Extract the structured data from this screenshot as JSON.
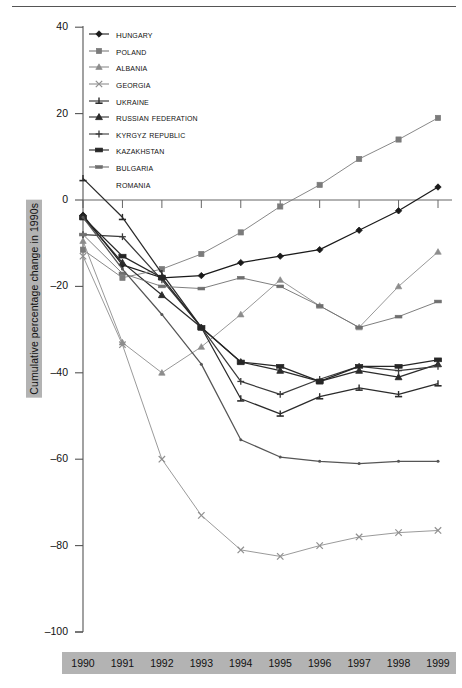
{
  "figure": {
    "top_rule": true,
    "background_color": "#ffffff",
    "band_color": "#b3b3b3"
  },
  "axes": {
    "y_label": "Cumulative percentage change in 1990s",
    "y_ticks": [
      40,
      20,
      0,
      -20,
      -40,
      -60,
      -80,
      -100
    ],
    "y_tick_labels": [
      "40",
      "20",
      "0",
      "–20",
      "–40",
      "–60",
      "–80",
      "–100"
    ],
    "x_tick_labels": [
      "1990",
      "1991",
      "1992",
      "1993",
      "1994",
      "1995",
      "1996",
      "1997",
      "1998",
      "1999"
    ]
  },
  "legend": {
    "items": [
      {
        "label": "Hungary",
        "marker": "diamond",
        "color": "#1a1a1a"
      },
      {
        "label": "Poland",
        "marker": "square",
        "color": "#7b7b7b"
      },
      {
        "label": "Albania",
        "marker": "triangle",
        "color": "#8c8c8c"
      },
      {
        "label": "Georgia",
        "marker": "cross-x",
        "color": "#8f8f8f"
      },
      {
        "label": "Ukraine",
        "marker": "bar-plus",
        "color": "#2b2b2b"
      },
      {
        "label": "Russian Federation",
        "marker": "triangle-solid",
        "color": "#2b2b2b"
      },
      {
        "label": "Kyrgyz Republic",
        "marker": "plus",
        "color": "#3a3a3a"
      },
      {
        "label": "Kazakhstan",
        "marker": "rect-wide",
        "color": "#262626"
      },
      {
        "label": "Bulgaria",
        "marker": "dash",
        "color": "#6f6f6f"
      },
      {
        "label": "Romania",
        "marker": "none",
        "color": "#555555"
      }
    ]
  },
  "chart_data": {
    "type": "line",
    "title": "",
    "subtitle": "",
    "xlabel": "",
    "ylabel": "Cumulative percentage change in 1990s",
    "xlim": [
      1990,
      1999
    ],
    "ylim": [
      -100,
      40
    ],
    "grid": false,
    "legend_position": "top-left inside",
    "x": [
      1990,
      1991,
      1992,
      1993,
      1994,
      1995,
      1996,
      1997,
      1998,
      1999
    ],
    "categories": [
      "1990",
      "1991",
      "1992",
      "1993",
      "1994",
      "1995",
      "1996",
      "1997",
      "1998",
      "1999"
    ],
    "series": [
      {
        "name": "Hungary",
        "marker": "diamond",
        "color": "#1a1a1a",
        "values": [
          -3.5,
          -15.0,
          -18.0,
          -17.5,
          -14.5,
          -13.0,
          -11.5,
          -7.0,
          -2.5,
          3.0
        ]
      },
      {
        "name": "Poland",
        "marker": "square",
        "color": "#7b7b7b",
        "values": [
          -11.5,
          -18.0,
          -16.0,
          -12.5,
          -7.5,
          -1.5,
          3.5,
          9.5,
          14.0,
          19.0
        ]
      },
      {
        "name": "Albania",
        "marker": "triangle",
        "color": "#8c8c8c",
        "values": [
          -9.5,
          -33.0,
          -40.0,
          -34.0,
          -26.5,
          -18.5,
          -24.5,
          -29.5,
          -20.0,
          -12.0
        ]
      },
      {
        "name": "Georgia",
        "marker": "cross-x",
        "color": "#8f8f8f",
        "values": [
          -13.0,
          -33.5,
          -60.0,
          -73.0,
          -81.0,
          -82.5,
          -80.0,
          -78.0,
          -77.0,
          -76.5
        ]
      },
      {
        "name": "Ukraine",
        "marker": "bar-plus",
        "color": "#2b2b2b",
        "values": [
          5.0,
          -4.0,
          -17.0,
          -29.5,
          -46.0,
          -49.5,
          -45.5,
          -43.5,
          -45.0,
          -42.5
        ]
      },
      {
        "name": "Russian Federation",
        "marker": "triangle-solid",
        "color": "#2b2b2b",
        "values": [
          -4.0,
          -14.5,
          -22.0,
          -29.5,
          -37.5,
          -39.5,
          -42.0,
          -39.5,
          -41.0,
          -38.0
        ]
      },
      {
        "name": "Kyrgyz Republic",
        "marker": "plus",
        "color": "#3a3a3a",
        "values": [
          -8.0,
          -8.5,
          -18.5,
          -29.5,
          -42.0,
          -45.0,
          -41.5,
          -38.5,
          -39.5,
          -38.5
        ]
      },
      {
        "name": "Kazakhstan",
        "marker": "rect-wide",
        "color": "#262626",
        "values": [
          -4.0,
          -13.0,
          -18.0,
          -29.5,
          -37.5,
          -38.5,
          -42.0,
          -38.5,
          -38.5,
          -37.0
        ]
      },
      {
        "name": "Bulgaria",
        "marker": "dash",
        "color": "#6f6f6f",
        "values": [
          -8.0,
          -17.0,
          -20.0,
          -20.5,
          -18.0,
          -20.0,
          -24.5,
          -29.5,
          -27.0,
          -23.5
        ]
      },
      {
        "name": "Romania",
        "marker": "none",
        "color": "#555555",
        "values": [
          -4.0,
          -16.0,
          -26.5,
          -38.0,
          -55.5,
          -59.5,
          -60.5,
          -61.0,
          -60.5,
          -60.5
        ]
      }
    ]
  }
}
